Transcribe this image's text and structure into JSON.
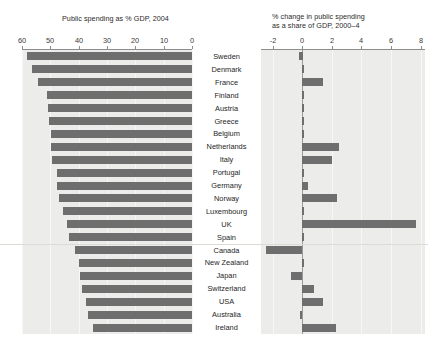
{
  "chart_data": {
    "type": "bar",
    "title": "",
    "orientation": "horizontal",
    "layout": "two-panel butterfly / paired horizontal bar chart with shared category axis in the centre",
    "categories": [
      "Sweden",
      "Denmark",
      "France",
      "Finland",
      "Austria",
      "Greece",
      "Belgium",
      "Netherlands",
      "Italy",
      "Portugal",
      "Germany",
      "Norway",
      "Luxembourg",
      "UK",
      "Spain",
      "Canada",
      "New Zealand",
      "Japan",
      "Switzerland",
      "USA",
      "Australia",
      "Ireland"
    ],
    "group_separator_after": "Spain",
    "panels": [
      {
        "id": "left",
        "title": "Public spending as % GDP, 2004",
        "xlabel": "",
        "ylabel": "",
        "axis_direction": "reversed",
        "xlim": [
          60,
          0
        ],
        "ticks": [
          60,
          50,
          40,
          30,
          20,
          10,
          0
        ],
        "tick_labels": [
          "60",
          "50",
          "40",
          "30",
          "20",
          "10",
          "0"
        ],
        "grid": true,
        "values": [
          58.2,
          56.3,
          54.4,
          51.2,
          50.8,
          50.5,
          49.9,
          49.6,
          49.3,
          47.8,
          47.5,
          46.8,
          45.5,
          44.0,
          43.5,
          41.2,
          40.0,
          39.5,
          38.8,
          37.5,
          36.8,
          35.1
        ]
      },
      {
        "id": "right",
        "title": "% change in public spending\nas a share of GDP, 2000–4",
        "xlabel": "",
        "ylabel": "",
        "axis_direction": "normal",
        "xlim": [
          -2.8,
          8.3
        ],
        "ticks": [
          -2,
          0,
          2,
          4,
          6,
          8
        ],
        "tick_labels": [
          "-2",
          "0",
          "2",
          "4",
          "6",
          "8"
        ],
        "grid": true,
        "zero_line": true,
        "values": [
          -0.25,
          0.0,
          1.4,
          0.0,
          0.0,
          0.0,
          0.1,
          2.5,
          2.0,
          0.0,
          0.4,
          2.4,
          0.0,
          7.7,
          0.1,
          -2.45,
          0.0,
          -0.75,
          0.8,
          1.4,
          -0.15,
          2.3
        ]
      }
    ],
    "series": [
      {
        "name": "Public spending as % GDP, 2004",
        "panel": "left",
        "values": [
          58.2,
          56.3,
          54.4,
          51.2,
          50.8,
          50.5,
          49.9,
          49.6,
          49.3,
          47.8,
          47.5,
          46.8,
          45.5,
          44.0,
          43.5,
          41.2,
          40.0,
          39.5,
          38.8,
          37.5,
          36.8,
          35.1
        ]
      },
      {
        "name": "% change in public spending as a share of GDP, 2000-4",
        "panel": "right",
        "values": [
          -0.25,
          0.0,
          1.4,
          0.0,
          0.0,
          0.0,
          0.1,
          2.5,
          2.0,
          0.0,
          0.4,
          2.4,
          0.0,
          7.7,
          0.1,
          -2.45,
          0.0,
          -0.75,
          0.8,
          1.4,
          -0.15,
          2.3
        ]
      }
    ],
    "colors": {
      "bar": "#6e6e6e",
      "panel_background": "#ececeb",
      "page_background": "#ffffff",
      "axis": "#8d8d8d",
      "gridline": "#f7f7f7",
      "separator": "#dedad6",
      "text": "#1e1e1e"
    }
  }
}
